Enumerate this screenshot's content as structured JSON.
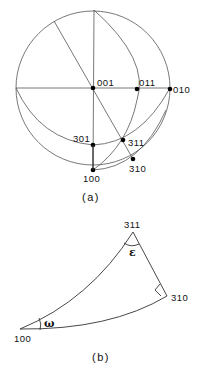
{
  "figure_a": {
    "caption": "(a)",
    "poles": [
      {
        "label": "001"
      },
      {
        "label": "011"
      },
      {
        "label": "010"
      },
      {
        "label": "301"
      },
      {
        "label": "311"
      },
      {
        "label": "310"
      },
      {
        "label": "100"
      }
    ]
  },
  "figure_b": {
    "caption": "(b)",
    "vertices": [
      {
        "label": "311"
      },
      {
        "label": "310"
      },
      {
        "label": "100"
      }
    ],
    "angles": {
      "at_311": "ε",
      "at_100": "ω"
    }
  }
}
